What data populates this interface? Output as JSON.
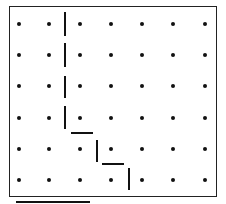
{
  "diagram": {
    "type": "dot-grid-path",
    "grid": {
      "columns": 7,
      "rows": 6,
      "dot_x": [
        19,
        49,
        80,
        111,
        142,
        173,
        205
      ],
      "dot_y": [
        24,
        55,
        86,
        118,
        149,
        180
      ],
      "dot_color": "#111111"
    },
    "segments": [
      {
        "x1": 65,
        "y1": 12,
        "x2": 65,
        "y2": 36
      },
      {
        "x1": 65,
        "y1": 43,
        "x2": 65,
        "y2": 67
      },
      {
        "x1": 65,
        "y1": 76,
        "x2": 65,
        "y2": 98
      },
      {
        "x1": 65,
        "y1": 106,
        "x2": 65,
        "y2": 129
      },
      {
        "x1": 71,
        "y1": 133,
        "x2": 93,
        "y2": 133
      },
      {
        "x1": 97,
        "y1": 140,
        "x2": 97,
        "y2": 162
      },
      {
        "x1": 102,
        "y1": 164,
        "x2": 124,
        "y2": 164
      },
      {
        "x1": 129,
        "y1": 168,
        "x2": 129,
        "y2": 190
      }
    ],
    "underline": {
      "x1": 16,
      "y1": 202,
      "x2": 90,
      "y2": 202
    },
    "line_color": "#111111"
  }
}
